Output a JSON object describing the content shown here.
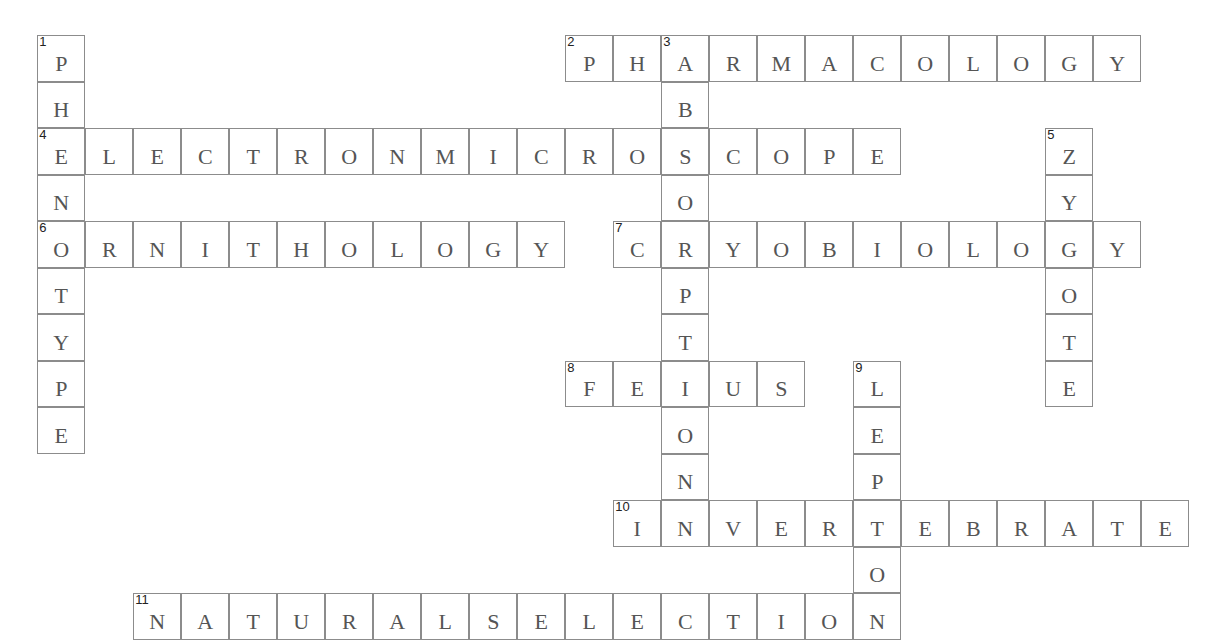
{
  "puzzle": {
    "grid": {
      "origin_x": 38,
      "origin_y": 36,
      "cell_w": 48,
      "cell_h": 46.5
    },
    "words": [
      {
        "number": "1",
        "direction": "down",
        "row": 0,
        "col": 0,
        "answer": "PHENOTYPE"
      },
      {
        "number": "2",
        "direction": "across",
        "row": 0,
        "col": 11,
        "answer": "PHARMACOLOGY"
      },
      {
        "number": "3",
        "direction": "down",
        "row": 0,
        "col": 13,
        "answer": "ABSORPTION"
      },
      {
        "number": "4",
        "direction": "across",
        "row": 2,
        "col": 0,
        "answer": "ELECTRONMICROSCOPE"
      },
      {
        "number": "5",
        "direction": "down",
        "row": 2,
        "col": 21,
        "answer": "ZYGOTE"
      },
      {
        "number": "6",
        "direction": "across",
        "row": 4,
        "col": 0,
        "answer": "ORNITHOLOGY"
      },
      {
        "number": "7",
        "direction": "across",
        "row": 4,
        "col": 12,
        "answer": "CRYOBIOLOGY"
      },
      {
        "number": "8",
        "direction": "across",
        "row": 7,
        "col": 11,
        "answer": "FETUS"
      },
      {
        "number": "9",
        "direction": "down",
        "row": 7,
        "col": 17,
        "answer": "LEPTON"
      },
      {
        "number": "10",
        "direction": "across",
        "row": 10,
        "col": 12,
        "answer": "INVERTEBRATE"
      },
      {
        "number": "11",
        "direction": "across",
        "row": 12,
        "col": 2,
        "answer": "NATURALSELECTION"
      }
    ]
  }
}
